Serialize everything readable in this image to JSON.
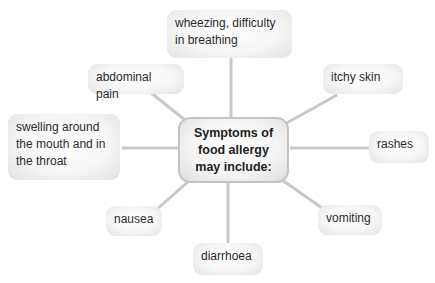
{
  "diagram": {
    "center": "Symptoms of food allergy may include:",
    "nodes": [
      {
        "id": "wheezing",
        "label": "wheezing, difficulty in breathing"
      },
      {
        "id": "abdominal",
        "label": "abdominal pain"
      },
      {
        "id": "itchy",
        "label": "itchy skin"
      },
      {
        "id": "swelling",
        "label": "swelling around the mouth and in the throat"
      },
      {
        "id": "rashes",
        "label": "rashes"
      },
      {
        "id": "nausea",
        "label": "nausea"
      },
      {
        "id": "vomiting",
        "label": "vomiting"
      },
      {
        "id": "diarrhoea",
        "label": "diarrhoea"
      }
    ],
    "colors": {
      "link": "#c8c8c8",
      "center_border": "#c4c4c4"
    }
  }
}
